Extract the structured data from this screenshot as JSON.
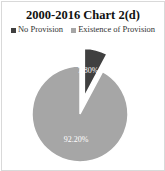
{
  "chart_data": {
    "type": "pie",
    "title": "2000-2016 Chart 2(d)",
    "categories": [
      "No Provision",
      "Existence of Provision"
    ],
    "values": [
      7.8,
      92.2
    ],
    "labels": [
      "7.80%",
      "92.20%"
    ],
    "colors": [
      "#404040",
      "#a6a6a6"
    ],
    "legend_position": "top",
    "exploded": [
      "No Provision"
    ]
  },
  "legend": [
    {
      "label": "No Provision",
      "color": "#404040"
    },
    {
      "label": "Existence of Provision",
      "color": "#a6a6a6"
    }
  ]
}
